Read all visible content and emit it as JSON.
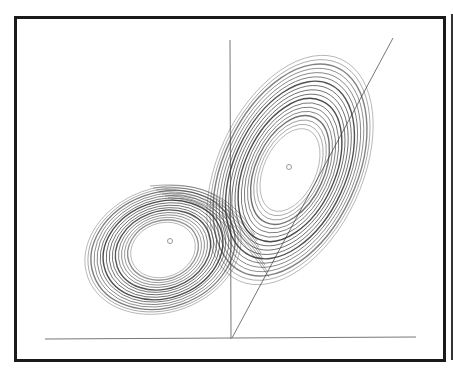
{
  "figure": {
    "kind": "Lorenz attractor (butterfly) phase portrait",
    "colors": {
      "trajectory": "#333333",
      "axes": "#777777",
      "frame": "#1a1a1a",
      "fixed_point": "#999999",
      "background": "#ffffff"
    },
    "axes": {
      "horizontal": {
        "x1": 45,
        "y1": 339,
        "x2": 416,
        "y2": 337
      },
      "vertical": {
        "x1": 230,
        "y1": 40,
        "x2": 231,
        "y2": 339
      },
      "diagonal": {
        "x1": 232,
        "y1": 338,
        "x2": 393,
        "y2": 38
      }
    },
    "fixed_points": [
      {
        "name": "left-fixed-point",
        "cx": 170,
        "cy": 241
      },
      {
        "name": "right-fixed-point",
        "cx": 289,
        "cy": 167
      }
    ],
    "left_lobe": {
      "cx": 163,
      "cy": 250,
      "rx_outer": 80,
      "ry_outer": 62,
      "rx_inner": 33,
      "ry_inner": 27,
      "angle": -20,
      "rings": 16
    },
    "right_lobe": {
      "cx": 290,
      "cy": 170,
      "rx_outer": 72,
      "ry_outer": 122,
      "rx_inner": 26,
      "ry_inner": 44,
      "angle": 25,
      "rings": 18
    }
  }
}
